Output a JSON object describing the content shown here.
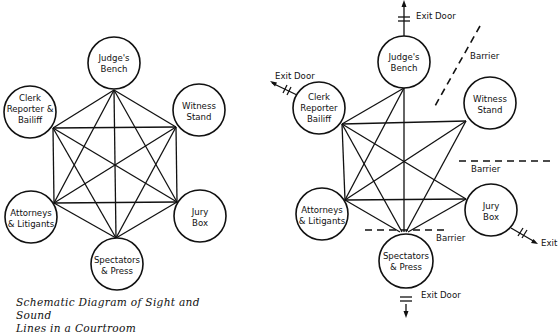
{
  "left_diagram": {
    "title": "Schematic Diagram of Sight and Sound Lines in a Courtroom",
    "caption_line1": "Schematic Diagram of Sight and Sound",
    "caption_line2": "Lines in a Courtroom",
    "nodes": [
      {
        "id": "judge",
        "line1": "Judge's",
        "line2": "Bench"
      },
      {
        "id": "clerk",
        "line1": "Clerk",
        "line2": "Reporter &",
        "line3": "Bailiff"
      },
      {
        "id": "witness",
        "line1": "Witness",
        "line2": "Stand"
      },
      {
        "id": "attorneys",
        "line1": "Attorneys",
        "line2": "& Litigants"
      },
      {
        "id": "jury",
        "line1": "Jury",
        "line2": "Box"
      },
      {
        "id": "spectators",
        "line1": "Spectators",
        "line2": "& Press"
      }
    ],
    "connections": "all nodes fully interconnected (15 sight/sound lines)"
  },
  "right_diagram": {
    "nodes": [
      {
        "id": "judge",
        "line1": "Judge's",
        "line2": "Bench"
      },
      {
        "id": "clerk",
        "line1": "Clerk",
        "line2": "Reporter",
        "line3": "Bailiff"
      },
      {
        "id": "witness",
        "line1": "Witness",
        "line2": "Stand"
      },
      {
        "id": "attorneys",
        "line1": "Attorneys",
        "line2": "& Litigants"
      },
      {
        "id": "jury",
        "line1": "Jury",
        "line2": "Box"
      },
      {
        "id": "spectators",
        "line1": "Spectators",
        "line2": "& Press"
      }
    ],
    "exits": {
      "judge": "Exit Door",
      "clerk": "Exit Door",
      "jury": "Exit",
      "spectators": "Exit Door"
    },
    "barriers": {
      "judge_witness": "Barrier",
      "witness_jury": "Barrier",
      "spectators": "Barrier"
    }
  }
}
